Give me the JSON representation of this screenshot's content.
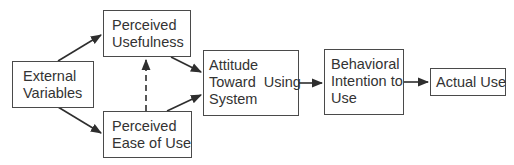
{
  "diagram": {
    "type": "flowchart",
    "title": "",
    "nodes": [
      {
        "id": "external_variables",
        "lines": [
          "External",
          "Variables"
        ]
      },
      {
        "id": "perceived_usefulness",
        "lines": [
          "Perceived",
          "Usefulness"
        ]
      },
      {
        "id": "perceived_ease_of_use",
        "lines": [
          "Perceived",
          "Ease of Use"
        ]
      },
      {
        "id": "attitude",
        "lines": [
          "Attitude",
          "Toward  Using",
          "System"
        ]
      },
      {
        "id": "behavioral_intention",
        "lines": [
          "Behavioral",
          "Intention to",
          "Use"
        ]
      },
      {
        "id": "actual_use",
        "lines": [
          "Actual Use"
        ]
      }
    ],
    "edges": [
      {
        "from": "external_variables",
        "to": "perceived_usefulness",
        "style": "solid"
      },
      {
        "from": "external_variables",
        "to": "perceived_ease_of_use",
        "style": "solid"
      },
      {
        "from": "perceived_ease_of_use",
        "to": "perceived_usefulness",
        "style": "dashed"
      },
      {
        "from": "perceived_usefulness",
        "to": "attitude",
        "style": "solid"
      },
      {
        "from": "perceived_ease_of_use",
        "to": "attitude",
        "style": "solid"
      },
      {
        "from": "attitude",
        "to": "behavioral_intention",
        "style": "solid"
      },
      {
        "from": "behavioral_intention",
        "to": "actual_use",
        "style": "solid"
      }
    ],
    "colors": {
      "stroke": "#3a3a3a",
      "text": "#333333",
      "background": "#ffffff"
    }
  }
}
